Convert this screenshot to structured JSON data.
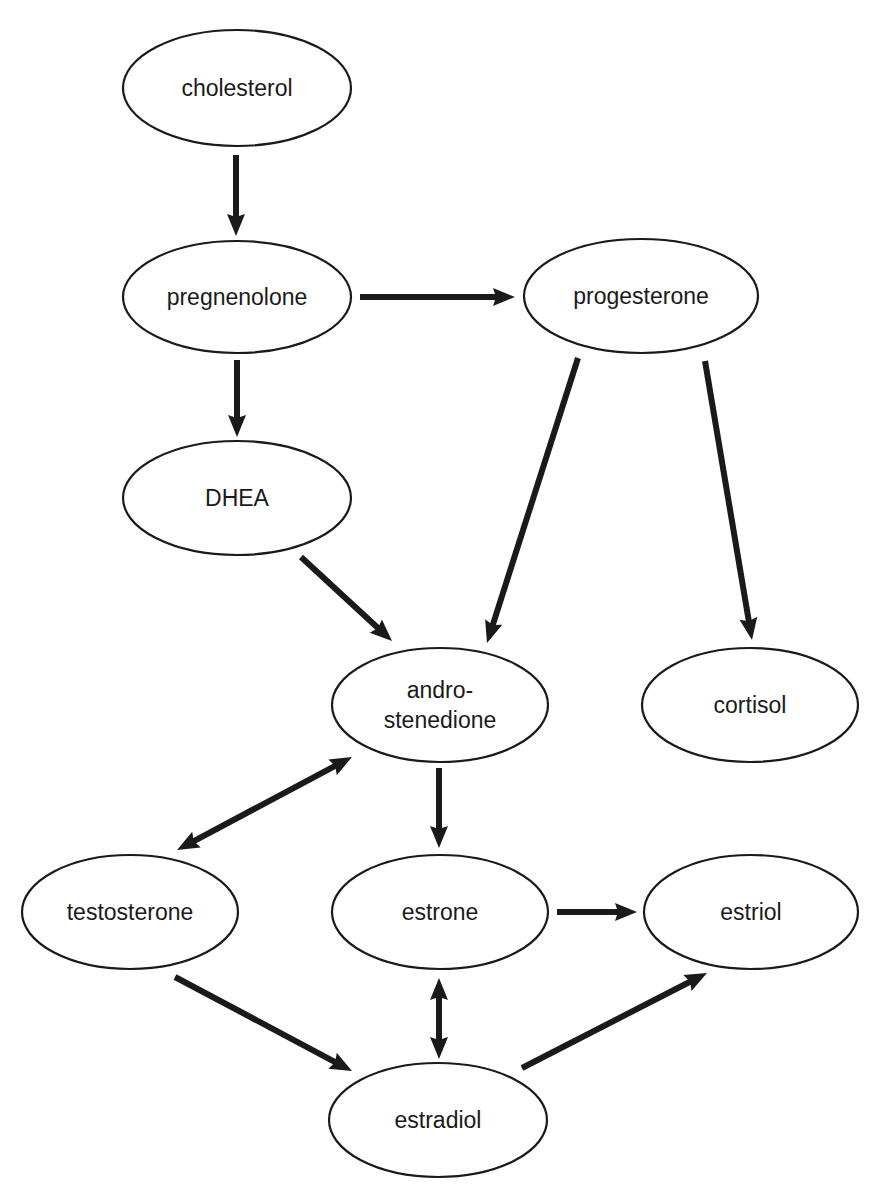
{
  "diagram": {
    "type": "flowchart",
    "title": "",
    "colors": {
      "stroke": "#1a1a1a",
      "fill": "#ffffff",
      "background": "#ffffff"
    },
    "nodes": [
      {
        "id": "cholesterol",
        "lines": [
          "cholesterol"
        ],
        "cx": 237,
        "cy": 88,
        "rx": 114,
        "ry": 58
      },
      {
        "id": "pregnenolone",
        "lines": [
          "pregnenolone"
        ],
        "cx": 237,
        "cy": 297,
        "rx": 114,
        "ry": 56
      },
      {
        "id": "progesterone",
        "lines": [
          "progesterone"
        ],
        "cx": 641,
        "cy": 296,
        "rx": 117,
        "ry": 57
      },
      {
        "id": "dhea",
        "lines": [
          "DHEA"
        ],
        "cx": 237,
        "cy": 498,
        "rx": 114,
        "ry": 57
      },
      {
        "id": "androstenedione",
        "lines": [
          "andro-",
          "stenedione"
        ],
        "cx": 440,
        "cy": 705,
        "rx": 108,
        "ry": 57
      },
      {
        "id": "cortisol",
        "lines": [
          "cortisol"
        ],
        "cx": 750,
        "cy": 705,
        "rx": 108,
        "ry": 57
      },
      {
        "id": "testosterone",
        "lines": [
          "testosterone"
        ],
        "cx": 130,
        "cy": 912,
        "rx": 108,
        "ry": 57
      },
      {
        "id": "estrone",
        "lines": [
          "estrone"
        ],
        "cx": 440,
        "cy": 912,
        "rx": 108,
        "ry": 57
      },
      {
        "id": "estriol",
        "lines": [
          "estriol"
        ],
        "cx": 751,
        "cy": 912,
        "rx": 107,
        "ry": 57
      },
      {
        "id": "estradiol",
        "lines": [
          "estradiol"
        ],
        "cx": 438,
        "cy": 1120,
        "rx": 109,
        "ry": 57
      }
    ],
    "edges": [
      {
        "from": "cholesterol",
        "to": "pregnenolone",
        "bidirectional": false,
        "x1": 236,
        "y1": 155,
        "x2": 236,
        "y2": 236
      },
      {
        "from": "pregnenolone",
        "to": "progesterone",
        "bidirectional": false,
        "x1": 360,
        "y1": 297,
        "x2": 515,
        "y2": 297
      },
      {
        "from": "pregnenolone",
        "to": "dhea",
        "bidirectional": false,
        "x1": 237,
        "y1": 360,
        "x2": 237,
        "y2": 437
      },
      {
        "from": "dhea",
        "to": "androstenedione",
        "bidirectional": false,
        "x1": 301,
        "y1": 557,
        "x2": 392,
        "y2": 641
      },
      {
        "from": "progesterone",
        "to": "androstenedione",
        "bidirectional": false,
        "x1": 578,
        "y1": 358,
        "x2": 487,
        "y2": 643
      },
      {
        "from": "progesterone",
        "to": "cortisol",
        "bidirectional": false,
        "x1": 705,
        "y1": 361,
        "x2": 752,
        "y2": 640
      },
      {
        "from": "androstenedione",
        "to": "testosterone",
        "bidirectional": true,
        "x1": 352,
        "y1": 757,
        "x2": 177,
        "y2": 850
      },
      {
        "from": "androstenedione",
        "to": "estrone",
        "bidirectional": false,
        "x1": 439,
        "y1": 768,
        "x2": 439,
        "y2": 848
      },
      {
        "from": "estrone",
        "to": "estriol",
        "bidirectional": false,
        "x1": 557,
        "y1": 912,
        "x2": 637,
        "y2": 912
      },
      {
        "from": "testosterone",
        "to": "estradiol",
        "bidirectional": false,
        "x1": 175,
        "y1": 977,
        "x2": 352,
        "y2": 1071
      },
      {
        "from": "estrone",
        "to": "estradiol",
        "bidirectional": true,
        "x1": 439,
        "y1": 978,
        "x2": 439,
        "y2": 1059
      },
      {
        "from": "estradiol",
        "to": "estriol",
        "bidirectional": false,
        "x1": 522,
        "y1": 1068,
        "x2": 707,
        "y2": 973
      }
    ]
  }
}
